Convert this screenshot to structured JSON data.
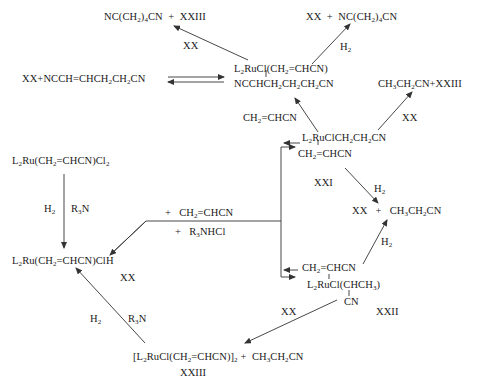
{
  "diagram": {
    "type": "reaction-scheme",
    "compounds": {
      "top_left_products": "NC(CH2)4CN + XXIII",
      "top_right_products": "XX + NC(CH2)4CN",
      "left_equilibrium_reactants": "XX + NCCH=CHCH2CH2CN",
      "central_complex_line1": "L2RuCl(CH2=CHCN)",
      "central_complex_line2": "NCCHCH2CH2CH2CN",
      "acrylonitrile_label": "CH2=CHCN",
      "right_products_top": "CH3CH2CN + XXIII",
      "xxi_line1": "L2RuClCH2CH2CN",
      "xxi_line2": "CH2=CHCN",
      "xxi_label": "XXI",
      "start_complex": "L2Ru(CH2=CHCN)Cl2",
      "hydride_complex": "L2Ru(CH2=CHCN)ClH",
      "middle_products": "XX + CH3CH2CN",
      "xxii_line1": "CH2=CHCN",
      "xxii_line2": "L2RuCl(CHCH3)",
      "xxii_line3": "CN",
      "xxii_label": "XXII",
      "dimer": "[L2RuCl(CH2=CHCN)]2 + CH3CH2CN",
      "dimer_label": "XXIII",
      "hydride_label": "XX"
    },
    "reagents": {
      "arrow_top_left": "XX",
      "arrow_top_right": "H2",
      "arrow_right_top": "XX",
      "arrow_xxi_down": "H2",
      "arrow_xxii_up": "H2",
      "arrow_xxii_down": "XX",
      "vertical_left_a": "H2",
      "vertical_left_b": "R3N",
      "branch_add": "+ CH2=CHCN",
      "branch_release": "+ R3NHCl",
      "bottom_left_a": "H2",
      "bottom_left_b": "R3N"
    }
  }
}
